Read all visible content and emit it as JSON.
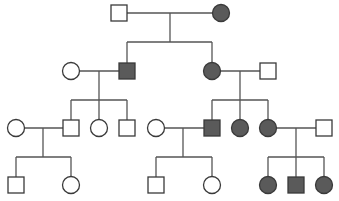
{
  "diagram": {
    "type": "pedigree",
    "colors": {
      "affected_fill": "#5a5a5a",
      "unaffected_fill": "#ffffff",
      "stroke": "#3a3a3a",
      "line": "#555555"
    },
    "generations": [
      {
        "id": "I",
        "individuals": [
          {
            "id": "I-1",
            "sex": "male",
            "affected": false
          },
          {
            "id": "I-2",
            "sex": "female",
            "affected": true
          }
        ]
      },
      {
        "id": "II",
        "individuals": [
          {
            "id": "II-1",
            "sex": "female",
            "affected": false,
            "spouse_of": "II-2"
          },
          {
            "id": "II-2",
            "sex": "male",
            "affected": true,
            "parents": [
              "I-1",
              "I-2"
            ]
          },
          {
            "id": "II-3",
            "sex": "female",
            "affected": true,
            "parents": [
              "I-1",
              "I-2"
            ]
          },
          {
            "id": "II-4",
            "sex": "male",
            "affected": false,
            "spouse_of": "II-3"
          }
        ]
      },
      {
        "id": "III",
        "individuals": [
          {
            "id": "III-1",
            "sex": "female",
            "affected": false,
            "spouse_of": "III-2"
          },
          {
            "id": "III-2",
            "sex": "male",
            "affected": false,
            "parents": [
              "II-1",
              "II-2"
            ]
          },
          {
            "id": "III-3",
            "sex": "female",
            "affected": false,
            "parents": [
              "II-1",
              "II-2"
            ]
          },
          {
            "id": "III-4",
            "sex": "male",
            "affected": false,
            "parents": [
              "II-1",
              "II-2"
            ]
          },
          {
            "id": "III-5",
            "sex": "female",
            "affected": false,
            "spouse_of": "III-6"
          },
          {
            "id": "III-6",
            "sex": "male",
            "affected": true,
            "parents": [
              "II-3",
              "II-4"
            ]
          },
          {
            "id": "III-7",
            "sex": "female",
            "affected": true,
            "parents": [
              "II-3",
              "II-4"
            ]
          },
          {
            "id": "III-8",
            "sex": "female",
            "affected": true,
            "parents": [
              "II-3",
              "II-4"
            ]
          },
          {
            "id": "III-9",
            "sex": "male",
            "affected": false,
            "spouse_of": "III-8"
          }
        ]
      },
      {
        "id": "IV",
        "individuals": [
          {
            "id": "IV-1",
            "sex": "male",
            "affected": false,
            "parents": [
              "III-1",
              "III-2"
            ]
          },
          {
            "id": "IV-2",
            "sex": "female",
            "affected": false,
            "parents": [
              "III-1",
              "III-2"
            ]
          },
          {
            "id": "IV-3",
            "sex": "male",
            "affected": false,
            "parents": [
              "III-5",
              "III-6"
            ]
          },
          {
            "id": "IV-4",
            "sex": "female",
            "affected": false,
            "parents": [
              "III-5",
              "III-6"
            ]
          },
          {
            "id": "IV-5",
            "sex": "female",
            "affected": true,
            "parents": [
              "III-8",
              "III-9"
            ]
          },
          {
            "id": "IV-6",
            "sex": "male",
            "affected": true,
            "parents": [
              "III-8",
              "III-9"
            ]
          },
          {
            "id": "IV-7",
            "sex": "female",
            "affected": true,
            "parents": [
              "III-8",
              "III-9"
            ]
          }
        ]
      }
    ]
  }
}
